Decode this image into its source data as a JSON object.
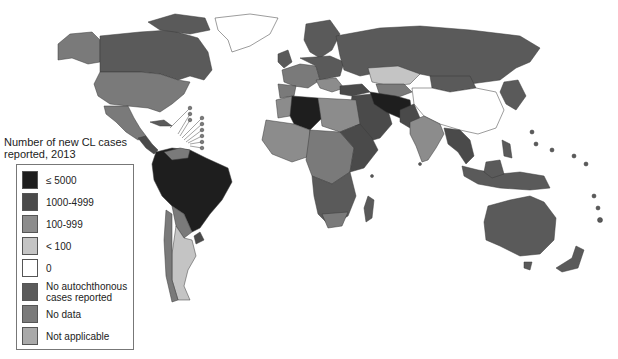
{
  "map": {
    "subject": "Number of new cutaneous leishmaniasis (CL) cases reported, 2013",
    "projection": "world choropleth"
  },
  "legend": {
    "title_line1": "Number of new CL cases",
    "title_line2": "reported, 2013",
    "items": [
      {
        "key": "gte5000",
        "label": "≤ 5000",
        "color": "#1e1e1e"
      },
      {
        "key": "1000_4999",
        "label": "1000-4999",
        "color": "#4a4a4a"
      },
      {
        "key": "100_999",
        "label": "100-999",
        "color": "#8c8c8c"
      },
      {
        "key": "lt100",
        "label": "< 100",
        "color": "#c4c4c4"
      },
      {
        "key": "zero",
        "label": "0",
        "color": "#ffffff"
      },
      {
        "key": "no_autochthonous",
        "label": "No autochthonous cases reported",
        "label_line1": "No autochthonous",
        "label_line2": "cases reported",
        "color": "#5a5a5a"
      },
      {
        "key": "no_data",
        "label": "No data",
        "color": "#7a7a7a"
      },
      {
        "key": "not_applicable",
        "label": "Not applicable",
        "color": "#a9a9a9"
      }
    ]
  },
  "colors": {
    "c5000": "#1e1e1e",
    "c1000": "#4a4a4a",
    "c100": "#8c8c8c",
    "clt100": "#c4c4c4",
    "czero": "#ffffff",
    "cnoauto": "#5a5a5a",
    "cnodata": "#7a7a7a",
    "cna": "#a9a9a9"
  }
}
